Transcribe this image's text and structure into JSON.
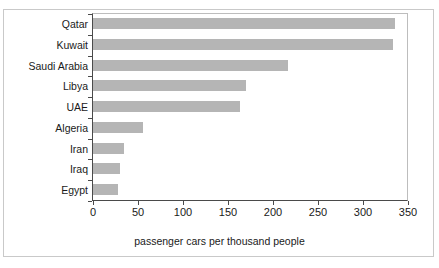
{
  "chart_data": {
    "type": "bar",
    "orientation": "horizontal",
    "title": "",
    "categories": [
      "Qatar",
      "Kuwait",
      "Saudi Arabia",
      "Libya",
      "UAE",
      "Algeria",
      "Iran",
      "Iraq",
      "Egypt"
    ],
    "values": [
      335,
      333,
      217,
      170,
      163,
      55,
      34,
      30,
      28
    ],
    "xlabel": "passenger cars per thousand people",
    "ylabel": "",
    "xlim": [
      0,
      350
    ],
    "xticks": [
      0,
      50,
      100,
      150,
      200,
      250,
      300,
      350
    ],
    "xtick_labels": [
      "0",
      "50",
      "100",
      "150",
      "200",
      "250",
      "300",
      "350"
    ],
    "grid": false,
    "legend": false,
    "bar_color": "#b5b5b5",
    "axis_color": "#4a4a4a",
    "text_color": "#1a1a1a"
  }
}
